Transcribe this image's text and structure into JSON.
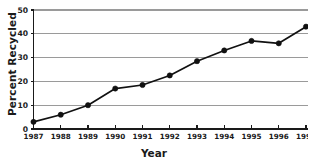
{
  "chart_data": {
    "type": "line",
    "title": "",
    "xlabel": "Year",
    "ylabel": "Percent Recycled",
    "categories": [
      "1987",
      "1988",
      "1989",
      "1990",
      "1991",
      "1992",
      "1993",
      "1994",
      "1995",
      "1996",
      "1997"
    ],
    "x": [
      1987,
      1988,
      1989,
      1990,
      1991,
      1992,
      1993,
      1994,
      1995,
      1996,
      1997
    ],
    "values": [
      3,
      6,
      10,
      17,
      18.5,
      22.5,
      28.5,
      33,
      37,
      36,
      43
    ],
    "series": [
      {
        "name": "Percent Recycled",
        "values": [
          3,
          6,
          10,
          17,
          18.5,
          22.5,
          28.5,
          33,
          37,
          36,
          43
        ]
      }
    ],
    "ylim": [
      0,
      50
    ],
    "xlim": [
      1987,
      1997
    ],
    "yticks": [
      0,
      10,
      20,
      30,
      40,
      50
    ],
    "ytick_labels": [
      "0",
      "10",
      "20",
      "30",
      "40",
      "50"
    ],
    "xticks": [
      1987,
      1988,
      1989,
      1990,
      1991,
      1992,
      1993,
      1994,
      1995,
      1996,
      1997
    ],
    "grid": true,
    "grid_axis": "y",
    "legend": false,
    "legend_position": "none",
    "marker": "circle",
    "line_color": "#111111",
    "marker_color": "#111111",
    "grid_color": "#9a9a9a",
    "axis_color": "#1a1a1a",
    "background_color": "#ffffff"
  }
}
